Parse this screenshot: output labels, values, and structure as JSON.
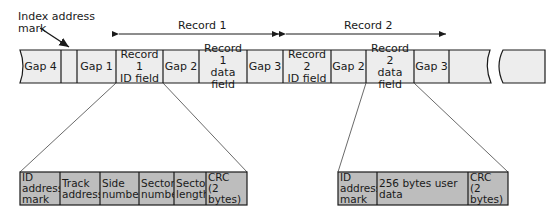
{
  "annotations": {
    "index_mark": "Index address\nmark",
    "record1": "Record 1",
    "record2": "Record 2"
  },
  "track_cells": [
    {
      "id": "gap4",
      "label": "Gap 4",
      "x": 20,
      "w": 41
    },
    {
      "id": "index",
      "label": "",
      "x": 61,
      "w": 16
    },
    {
      "id": "gap1",
      "label": "Gap 1",
      "x": 77,
      "w": 39
    },
    {
      "id": "r1id",
      "label": "Record 1\nID field",
      "x": 116,
      "w": 47
    },
    {
      "id": "r1gap2",
      "label": "Gap 2",
      "x": 163,
      "w": 36
    },
    {
      "id": "r1data",
      "label": "Record 1\ndata field",
      "x": 199,
      "w": 48
    },
    {
      "id": "r1gap3",
      "label": "Gap 3",
      "x": 247,
      "w": 36
    },
    {
      "id": "r2id",
      "label": "Record 2\nID field",
      "x": 283,
      "w": 48
    },
    {
      "id": "r2gap2",
      "label": "Gap 2",
      "x": 331,
      "w": 35
    },
    {
      "id": "r2data",
      "label": "Record 2\ndata field",
      "x": 366,
      "w": 48
    },
    {
      "id": "r2gap3",
      "label": "Gap 3",
      "x": 414,
      "w": 35
    },
    {
      "id": "blank1",
      "label": "",
      "x": 449,
      "w": 42
    },
    {
      "id": "blank2",
      "label": "",
      "x": 500,
      "w": 45
    }
  ],
  "id_field_detail": [
    {
      "label": "ID\naddress\nmark",
      "x": 20,
      "w": 40
    },
    {
      "label": "Track\naddress",
      "x": 60,
      "w": 40
    },
    {
      "label": "Side\nnumber",
      "x": 100,
      "w": 39
    },
    {
      "label": "Sector\nnumber",
      "x": 139,
      "w": 35
    },
    {
      "label": "Sector\nlength",
      "x": 174,
      "w": 32
    },
    {
      "label": "CRC\n(2 bytes)",
      "x": 206,
      "w": 41
    }
  ],
  "data_field_detail": [
    {
      "label": "ID\naddress\nmark",
      "x": 338,
      "w": 39
    },
    {
      "label": "256 bytes user data",
      "x": 377,
      "w": 91
    },
    {
      "label": "CRC\n(2 bytes)",
      "x": 468,
      "w": 40
    }
  ],
  "colors": {
    "track_fill": "#ededed",
    "detail_fill": "#bdbdbd",
    "stroke": "#1a1a1a"
  }
}
